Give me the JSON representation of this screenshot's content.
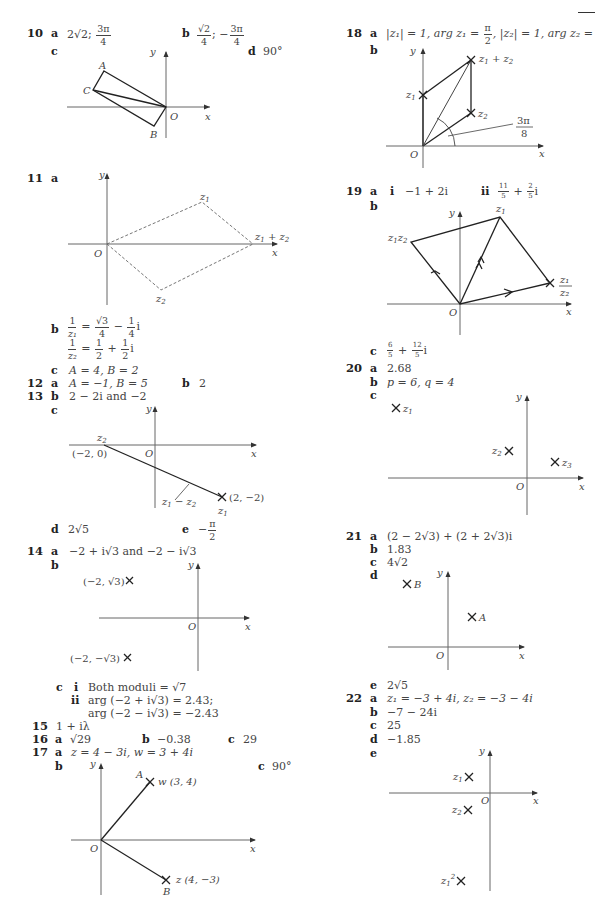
{
  "page": {
    "decorations": {
      "top_right_rule": true
    }
  },
  "left_column": {
    "q10": {
      "number": "10",
      "a": {
        "label": "a",
        "value_prefix": "2√2;",
        "frac_num": "3π",
        "frac_den": "4"
      },
      "b": {
        "label": "b",
        "frac1_num": "√2",
        "frac1_den": "4",
        "sep": "; −",
        "frac2_num": "3π",
        "frac2_den": "4"
      },
      "c": {
        "label": "c"
      },
      "d": {
        "label": "d",
        "value": "90°"
      },
      "diagram": {
        "labels": {
          "y": "y",
          "x": "x",
          "O": "O",
          "A": "A",
          "B": "B",
          "C": "C"
        }
      }
    },
    "q11": {
      "number": "11",
      "a": {
        "label": "a"
      },
      "diagram": {
        "labels": {
          "y": "y",
          "x": "x",
          "O": "O",
          "z1": "z",
          "z1_sub": "1",
          "z2": "z",
          "z2_sub": "2",
          "sum": "z",
          "sum_sub1": "1",
          "sum_plus": " + z",
          "sum_sub2": "2"
        }
      },
      "b": {
        "label": "b",
        "line1": {
          "lhs_num": "1",
          "lhs_den": "z₁",
          "eq": "=",
          "t1_num": "√3",
          "t1_den": "4",
          "op": "−",
          "t2_num": "1",
          "t2_den": "4",
          "suffix": "i"
        },
        "line2": {
          "lhs_num": "1",
          "lhs_den": "z₂",
          "eq": "=",
          "t1_num": "1",
          "t1_den": "2",
          "op": "+",
          "t2_num": "1",
          "t2_den": "2",
          "suffix": "i"
        }
      },
      "c": {
        "label": "c",
        "value": "A = 4, B = 2"
      }
    },
    "q12": {
      "number": "12",
      "a": {
        "label": "a",
        "value": "A = −1, B = 5"
      },
      "b": {
        "label": "b",
        "value": "2"
      }
    },
    "q13": {
      "number": "13",
      "b": {
        "label": "b",
        "value": "2 − 2i and −2"
      },
      "c": {
        "label": "c"
      },
      "diagram": {
        "labels": {
          "y": "y",
          "x": "x",
          "O": "O",
          "z2": "z",
          "z2_sub": "2",
          "p2": "(−2, 0)",
          "p1": "(2, −2)",
          "z1": "z",
          "z1_sub": "1",
          "diff": "z",
          "diff_sub1": "1",
          "diff_minus": " − z",
          "diff_sub2": "2"
        }
      },
      "d": {
        "label": "d",
        "value": "2√5"
      },
      "e": {
        "label": "e",
        "prefix": "−",
        "frac_num": "π",
        "frac_den": "2"
      }
    },
    "q14": {
      "number": "14",
      "a": {
        "label": "a",
        "value": "−2 + i√3 and −2 − i√3"
      },
      "b": {
        "label": "b"
      },
      "diagram": {
        "labels": {
          "y": "y",
          "x": "x",
          "O": "O",
          "p1": "(−2, √3)",
          "p2": "(−2, −√3)"
        }
      },
      "c": {
        "label": "c",
        "i": {
          "label": "i",
          "value": "Both moduli = √7"
        },
        "ii": {
          "label": "ii",
          "line1": "arg (−2 + i√3) = 2.43;",
          "line2": "arg (−2 − i√3) = −2.43"
        }
      }
    },
    "q15": {
      "number": "15",
      "value": "1 + iλ"
    },
    "q16": {
      "number": "16",
      "a": {
        "label": "a",
        "value": "√29"
      },
      "b": {
        "label": "b",
        "value": "−0.38"
      },
      "c": {
        "label": "c",
        "value": "29"
      }
    },
    "q17": {
      "number": "17",
      "a": {
        "label": "a",
        "value": "z = 4 − 3i, w = 3 + 4i"
      },
      "b": {
        "label": "b"
      },
      "c": {
        "label": "c",
        "value": "90°"
      },
      "diagram": {
        "labels": {
          "y": "y",
          "x": "x",
          "O": "O",
          "A": "A",
          "B": "B",
          "w": "w (3, 4)",
          "z": "z (4, −3)"
        }
      }
    }
  },
  "right_column": {
    "q18": {
      "number": "18",
      "a": {
        "label": "a",
        "p1": "|z₁| = 1, arg z₁ =",
        "f1_num": "π",
        "f1_den": "2",
        "p2": ", |z₂| = 1, arg z₂ =",
        "f2_num": "π",
        "f2_den": "4"
      },
      "b": {
        "label": "b"
      },
      "diagram": {
        "labels": {
          "y": "y",
          "x": "x",
          "O": "O",
          "z1": "z",
          "z1_sub": "1",
          "z2": "z",
          "z2_sub": "2",
          "sum": "z",
          "sum_sub1": "1",
          "sum_plus": " + z",
          "sum_sub2": "2",
          "angle_num": "3π",
          "angle_den": "8"
        }
      }
    },
    "q19": {
      "number": "19",
      "a": {
        "label": "a",
        "i": {
          "label": "i",
          "value": "−1 + 2i"
        },
        "ii": {
          "label": "ii",
          "f1_num": "11",
          "f1_den": "5",
          "op": "+",
          "f2_num": "2",
          "f2_den": "5",
          "suffix": "i"
        }
      },
      "b": {
        "label": "b"
      },
      "diagram": {
        "labels": {
          "y": "y",
          "x": "x",
          "O": "O",
          "z1": "z",
          "z1_sub": "1",
          "prod": "z",
          "prod_sub1": "1",
          "prod_z2": "z",
          "prod_sub2": "2",
          "quot_num": "z₁",
          "quot_den": "z₂"
        }
      },
      "c": {
        "label": "c",
        "f1_num": "6",
        "f1_den": "5",
        "op": "+",
        "f2_num": "12",
        "f2_den": "5",
        "suffix": "i"
      }
    },
    "q20": {
      "number": "20",
      "a": {
        "label": "a",
        "value": "2.68"
      },
      "b": {
        "label": "b",
        "value": "p = 6, q = 4"
      },
      "c": {
        "label": "c"
      },
      "diagram": {
        "labels": {
          "y": "y",
          "x": "x",
          "O": "O",
          "z1": "z",
          "z1_sub": "1",
          "z2": "z",
          "z2_sub": "2",
          "z3": "z",
          "z3_sub": "3"
        }
      }
    },
    "q21": {
      "number": "21",
      "a": {
        "label": "a",
        "value": "(2 − 2√3) + (2 + 2√3)i"
      },
      "b": {
        "label": "b",
        "value": "1.83"
      },
      "c": {
        "label": "c",
        "value": "4√2"
      },
      "d": {
        "label": "d"
      },
      "diagram": {
        "labels": {
          "y": "y",
          "x": "x",
          "O": "O",
          "A": "A",
          "B": "B"
        }
      },
      "e": {
        "label": "e",
        "value": "2√5"
      }
    },
    "q22": {
      "number": "22",
      "a": {
        "label": "a",
        "value": "z₁ = −3 + 4i, z₂ = −3 − 4i"
      },
      "b": {
        "label": "b",
        "value": "−7 − 24i"
      },
      "c": {
        "label": "c",
        "value": "25"
      },
      "d": {
        "label": "d",
        "value": "−1.85"
      },
      "e": {
        "label": "e"
      },
      "diagram": {
        "labels": {
          "y": "y",
          "x": "x",
          "O": "O",
          "z1": "z",
          "z1_sub": "1",
          "z2": "z",
          "z2_sub": "2",
          "z1sq": "z",
          "z1sq_sub": "1",
          "z1sq_sup": "2"
        }
      }
    }
  }
}
